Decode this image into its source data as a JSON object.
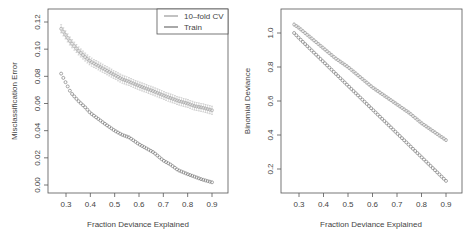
{
  "chart_data": [
    {
      "type": "scatter",
      "panel": "left",
      "title": "",
      "xlabel": "Fraction Deviance Explained",
      "ylabel": "Misclassification Error",
      "xlim": [
        0.23,
        0.93
      ],
      "ylim": [
        -0.005,
        0.13
      ],
      "xticks": [
        0.3,
        0.4,
        0.5,
        0.6,
        0.7,
        0.8,
        0.9
      ],
      "xtick_labels": [
        "0.3",
        "0.4",
        "0.5",
        "0.6",
        "0.7",
        "0.8",
        "0.9"
      ],
      "yticks": [
        0.0,
        0.02,
        0.04,
        0.06,
        0.08,
        0.1,
        0.12
      ],
      "ytick_labels": [
        "0.00",
        "0.02",
        "0.04",
        "0.06",
        "0.08",
        "0.10",
        "0.12"
      ],
      "grid": false,
      "legend": {
        "position": "top-right",
        "entries": [
          {
            "label": "10–fold CV",
            "color": "#9a9a9a"
          },
          {
            "label": "Train",
            "color": "#6e6e6e"
          }
        ]
      },
      "series": [
        {
          "name": "10-fold CV",
          "marker": "circle-with-errorbars",
          "color": "#9a9a9a",
          "x": [
            0.28,
            0.3,
            0.32,
            0.35,
            0.38,
            0.4,
            0.43,
            0.46,
            0.5,
            0.53,
            0.56,
            0.6,
            0.63,
            0.66,
            0.7,
            0.73,
            0.76,
            0.8,
            0.83,
            0.86,
            0.9
          ],
          "y": [
            0.115,
            0.11,
            0.105,
            0.099,
            0.094,
            0.091,
            0.088,
            0.085,
            0.081,
            0.078,
            0.076,
            0.073,
            0.071,
            0.069,
            0.066,
            0.064,
            0.062,
            0.06,
            0.058,
            0.057,
            0.055
          ],
          "error": 0.003
        },
        {
          "name": "Train",
          "marker": "circle",
          "color": "#6e6e6e",
          "x": [
            0.28,
            0.3,
            0.32,
            0.35,
            0.38,
            0.4,
            0.43,
            0.46,
            0.5,
            0.53,
            0.56,
            0.6,
            0.63,
            0.66,
            0.7,
            0.73,
            0.76,
            0.8,
            0.83,
            0.86,
            0.9
          ],
          "y": [
            0.082,
            0.075,
            0.068,
            0.062,
            0.057,
            0.053,
            0.049,
            0.045,
            0.04,
            0.037,
            0.035,
            0.03,
            0.027,
            0.024,
            0.018,
            0.015,
            0.011,
            0.008,
            0.006,
            0.004,
            0.002
          ]
        }
      ]
    },
    {
      "type": "scatter",
      "panel": "right",
      "title": "",
      "xlabel": "Fraction Deviance Explained",
      "ylabel": "Binomial Deviance",
      "xlim": [
        0.23,
        0.93
      ],
      "ylim": [
        0.07,
        1.12
      ],
      "xticks": [
        0.3,
        0.4,
        0.5,
        0.6,
        0.7,
        0.8,
        0.9
      ],
      "xtick_labels": [
        "0.3",
        "0.4",
        "0.5",
        "0.6",
        "0.7",
        "0.8",
        "0.9"
      ],
      "yticks": [
        0.2,
        0.4,
        0.6,
        0.8,
        1.0
      ],
      "ytick_labels": [
        "0.2",
        "0.4",
        "0.6",
        "0.8",
        "1.0"
      ],
      "grid": false,
      "series": [
        {
          "name": "10-fold CV",
          "marker": "circle-with-errorbars",
          "color": "#9a9a9a",
          "x": [
            0.28,
            0.3,
            0.35,
            0.4,
            0.45,
            0.5,
            0.55,
            0.6,
            0.65,
            0.7,
            0.75,
            0.8,
            0.85,
            0.9
          ],
          "y": [
            1.05,
            1.03,
            0.97,
            0.91,
            0.85,
            0.8,
            0.74,
            0.68,
            0.63,
            0.58,
            0.53,
            0.47,
            0.42,
            0.37
          ],
          "error": 0.005
        },
        {
          "name": "Train",
          "marker": "circle",
          "color": "#6e6e6e",
          "x": [
            0.28,
            0.3,
            0.35,
            0.4,
            0.45,
            0.5,
            0.55,
            0.6,
            0.65,
            0.7,
            0.75,
            0.8,
            0.85,
            0.9
          ],
          "y": [
            1.0,
            0.97,
            0.9,
            0.83,
            0.76,
            0.69,
            0.62,
            0.55,
            0.48,
            0.41,
            0.34,
            0.27,
            0.2,
            0.13
          ]
        }
      ]
    }
  ],
  "panels": {
    "left": {
      "ylabel": "Misclassification Error",
      "xlabel": "Fraction Deviance Explained",
      "legend": {
        "cv_label": "10–fold CV",
        "train_label": "Train"
      }
    },
    "right": {
      "ylabel": "Binomial Deviance",
      "xlabel": "Fraction Deviance Explained"
    }
  },
  "colors": {
    "cv": "#9a9a9a",
    "train": "#6e6e6e",
    "axis": "#555555",
    "text": "#444444"
  }
}
